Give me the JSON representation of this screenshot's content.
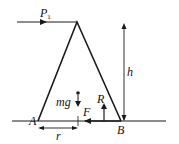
{
  "diagram": {
    "type": "free-body diagram",
    "colors": {
      "stroke": "#1a1a1a",
      "background": "#ffffff"
    },
    "labels": {
      "force_top": "P",
      "force_top_subscript": "1",
      "height": "h",
      "weight": "mg",
      "normal": "R",
      "friction": "F",
      "point_left": "A",
      "point_right": "B",
      "distance": "r"
    }
  }
}
